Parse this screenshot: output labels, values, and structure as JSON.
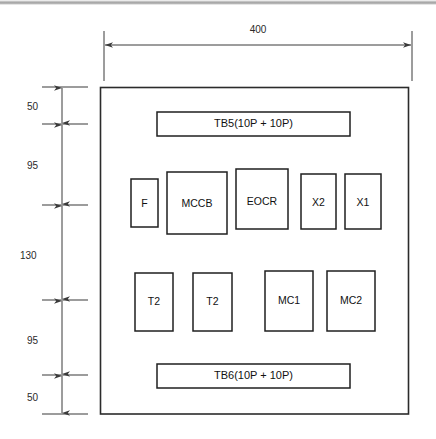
{
  "drawing": {
    "title": "Control Panel Component Layout",
    "type": "mechanical-layout-drawing",
    "units": "mm",
    "line_color": "#1f1f1f",
    "dimension_color": "#3a3a3a",
    "background_color": "#ffffff"
  },
  "dimensions": {
    "horizontal": [
      {
        "name": "overall-width",
        "label": "400",
        "orientation": "horizontal"
      }
    ],
    "vertical_chain": [
      {
        "name": "top-margin",
        "label": "50"
      },
      {
        "name": "tb5-to-row1",
        "label": "95"
      },
      {
        "name": "row1-to-row2",
        "label": "130"
      },
      {
        "name": "row2-to-tb6",
        "label": "95"
      },
      {
        "name": "bottom-margin",
        "label": "50"
      }
    ]
  },
  "panel": {
    "name": "enclosure-panel",
    "terminal_blocks": [
      {
        "id": "tb5",
        "label": "TB5(10P + 10P)",
        "position": "top"
      },
      {
        "id": "tb6",
        "label": "TB6(10P + 10P)",
        "position": "bottom"
      }
    ],
    "rows": [
      {
        "name": "component-row-upper",
        "components": [
          {
            "id": "f",
            "label": "F"
          },
          {
            "id": "mccb",
            "label": "MCCB"
          },
          {
            "id": "eocr",
            "label": "EOCR"
          },
          {
            "id": "x2",
            "label": "X2"
          },
          {
            "id": "x1",
            "label": "X1"
          }
        ]
      },
      {
        "name": "component-row-lower",
        "components": [
          {
            "id": "t2-a",
            "label": "T2"
          },
          {
            "id": "t2-b",
            "label": "T2"
          },
          {
            "id": "mc1",
            "label": "MC1"
          },
          {
            "id": "mc2",
            "label": "MC2"
          }
        ]
      }
    ]
  }
}
